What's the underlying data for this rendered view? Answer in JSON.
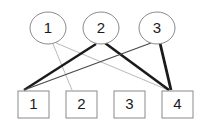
{
  "diagram": {
    "background_color": "#ffffff",
    "top_nodes": [
      {
        "id": "t1",
        "label": "1",
        "shape": "circle",
        "cx": 48,
        "cy": 28,
        "rx": 18,
        "ry": 16
      },
      {
        "id": "t2",
        "label": "2",
        "shape": "circle",
        "cx": 101,
        "cy": 28,
        "rx": 18,
        "ry": 16
      },
      {
        "id": "t3",
        "label": "3",
        "shape": "circle",
        "cx": 157,
        "cy": 28,
        "rx": 18,
        "ry": 16
      }
    ],
    "bottom_nodes": [
      {
        "id": "b1",
        "label": "1",
        "shape": "square",
        "x": 18,
        "y": 91,
        "w": 31,
        "h": 27
      },
      {
        "id": "b2",
        "label": "2",
        "shape": "square",
        "x": 66,
        "y": 91,
        "w": 31,
        "h": 27
      },
      {
        "id": "b3",
        "label": "3",
        "shape": "square",
        "x": 114,
        "y": 91,
        "w": 31,
        "h": 27
      },
      {
        "id": "b4",
        "label": "4",
        "shape": "square",
        "x": 162,
        "y": 91,
        "w": 31,
        "h": 27
      }
    ],
    "edges": [
      {
        "from": "t1",
        "to": "b2",
        "x1": 53,
        "y1": 44,
        "x2": 72,
        "y2": 90,
        "color": "#b9b9b9",
        "width": 1
      },
      {
        "from": "t1",
        "to": "b4",
        "x1": 56,
        "y1": 43,
        "x2": 168,
        "y2": 90,
        "color": "#b9b9b9",
        "width": 1
      },
      {
        "from": "t2",
        "to": "b1",
        "x1": 96,
        "y1": 44,
        "x2": 24,
        "y2": 90,
        "color": "#1a1a1a",
        "width": 2.4
      },
      {
        "from": "t2",
        "to": "b4",
        "x1": 105,
        "y1": 43,
        "x2": 169,
        "y2": 90,
        "color": "#1a1a1a",
        "width": 2.6
      },
      {
        "from": "t3",
        "to": "b1",
        "x1": 151,
        "y1": 43,
        "x2": 24,
        "y2": 90,
        "color": "#4a4a4a",
        "width": 1.3
      },
      {
        "from": "t3",
        "to": "b4",
        "x1": 160,
        "y1": 43,
        "x2": 171,
        "y2": 90,
        "color": "#1a1a1a",
        "width": 2.8
      }
    ],
    "palette": {
      "node_stroke": "#8a8a8a",
      "node_fill": "#ffffff",
      "label_color": "#1a1a1a",
      "edge_light": "#b9b9b9",
      "edge_mid": "#4a4a4a",
      "edge_dark": "#1a1a1a"
    }
  }
}
